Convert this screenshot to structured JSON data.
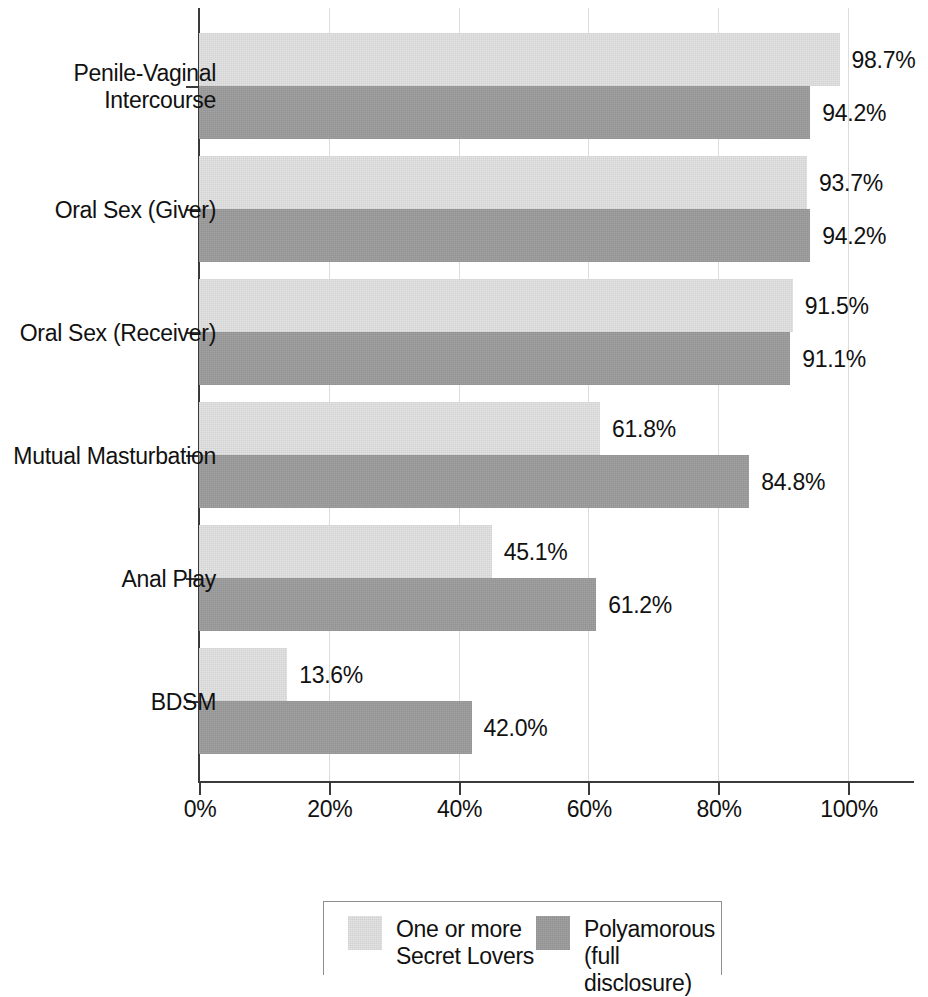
{
  "chart_data": {
    "type": "bar",
    "orientation": "horizontal",
    "title": "",
    "subtitle": "",
    "xlabel": "",
    "ylabel": "",
    "xlim": [
      0,
      110
    ],
    "x_ticks": [
      0,
      20,
      40,
      60,
      80,
      100
    ],
    "x_tick_labels": [
      "0%",
      "20%",
      "40%",
      "60%",
      "80%",
      "100%"
    ],
    "grid": "vertical",
    "legend_position": "bottom-center",
    "categories": [
      "Penile-Vaginal\nIntercourse",
      "Oral Sex (Giver)",
      "Oral Sex (Receiver)",
      "Mutual Masturbation",
      "Anal Play",
      "BDSM"
    ],
    "series": [
      {
        "name": "One or more\nSecret Lovers",
        "color": "#e2e2e2",
        "values": [
          98.7,
          93.7,
          91.5,
          61.8,
          45.1,
          13.6
        ],
        "labels": [
          "98.7%",
          "93.7%",
          "91.5%",
          "61.8%",
          "45.1%",
          "13.6%"
        ]
      },
      {
        "name": "Polyamorous\n(full disclosure)",
        "color": "#9d9d9d",
        "values": [
          94.2,
          94.2,
          91.1,
          84.8,
          61.2,
          42.0
        ],
        "labels": [
          "94.2%",
          "94.2%",
          "91.1%",
          "84.8%",
          "61.2%",
          "42.0%"
        ]
      }
    ]
  },
  "legend": {
    "entries": [
      {
        "label": "One or more\nSecret Lovers",
        "swatch": "light"
      },
      {
        "label": "Polyamorous\n(full disclosure)",
        "swatch": "dark"
      }
    ]
  },
  "colors": {
    "series_light": "#e2e2e2",
    "series_dark": "#9d9d9d",
    "axis": "#3a3a3a",
    "grid": "#dcdcdc",
    "text": "#111111"
  }
}
